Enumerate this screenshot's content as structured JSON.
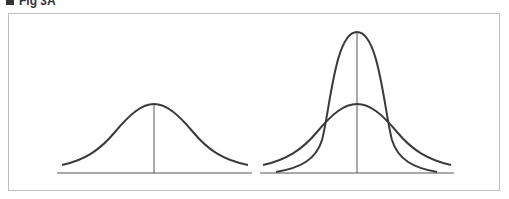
{
  "header": {
    "label": "Fig 3A",
    "marker": "square-bullet"
  },
  "colors": {
    "curve": "#3a3a3a",
    "axis": "#555555",
    "frame": "#bdbdbd"
  },
  "panels": [
    {
      "name": "single-normal-curve",
      "baseline": {
        "x1": 57,
        "x2": 252,
        "y": 173
      },
      "center_line": {
        "x": 154,
        "y_top": 104
      },
      "curves": [
        {
          "name": "wide-curve",
          "peak_y": 104,
          "x_start": 62,
          "x_end": 248,
          "end_y": 165
        }
      ]
    },
    {
      "name": "two-normal-curves",
      "baseline": {
        "x1": 260,
        "x2": 454,
        "y": 173
      },
      "center_line": {
        "x": 357,
        "y_top": 32
      },
      "curves": [
        {
          "name": "wide-curve",
          "peak_y": 104,
          "x_start": 263,
          "x_end": 451,
          "end_y": 165
        },
        {
          "name": "narrow-tall-curve",
          "peak_y": 32,
          "x_start": 276,
          "x_end": 437,
          "end_y": 172
        }
      ]
    }
  ]
}
